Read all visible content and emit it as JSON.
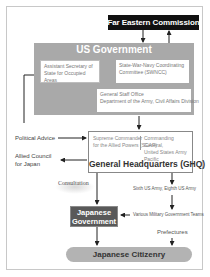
{
  "diagram": {
    "nodes": {
      "far_eastern_commission": "Far Eastern Commission",
      "us_government": "US Government",
      "assistant_secretary": "Assistant Secretary of State for Occupied Areas",
      "swncc": "State-War-Navy Coordinating Committee (SWNCC)",
      "general_staff_office_line1": "General Staff Office",
      "general_staff_office_line2": "Department of the Army, Civil Affairs Division",
      "scap_line1": "Supreme Commander",
      "scap_line2": "for the Allied Powers (SCAP)",
      "cg_line1": "Commanding General,",
      "cg_line2": "United States Army Pacific",
      "ghq": "General Headquarters (GHQ)",
      "political_advice": "Political Advice",
      "allied_council_line1": "Allied Council",
      "allied_council_line2": "for Japan",
      "consultation": "Consultation",
      "sixth_eighth_army": "Sixth US Army, Eighth US Army",
      "military_govt_teams": "Various Military Government Teams",
      "prefectures": "Prefectures",
      "japanese_government_line1": "Japanese",
      "japanese_government_line2": "Government",
      "japanese_citizenry": "Japanese Citizenry"
    },
    "edges": [
      {
        "from": "US Government",
        "to": "Far Eastern Commission"
      },
      {
        "from": "Far Eastern Commission",
        "to": "US Government"
      },
      {
        "from": "State-War-Navy Coordinating Committee (SWNCC)",
        "to": "Assistant Secretary of State for Occupied Areas"
      },
      {
        "from": "Assistant Secretary of State for Occupied Areas",
        "to": "General Staff Office"
      },
      {
        "from": "General Staff Office",
        "to": "General Headquarters (GHQ)"
      },
      {
        "from": "Assistant Secretary of State for Occupied Areas",
        "to": "General Headquarters (GHQ)",
        "label": "Political Advice"
      },
      {
        "from": "General Headquarters (GHQ)",
        "to": "Allied Council for Japan"
      },
      {
        "from": "General Headquarters (GHQ)",
        "to": "Japanese Government",
        "label": "Consultation"
      },
      {
        "from": "General Headquarters (GHQ)",
        "to": "Sixth US Army, Eighth US Army"
      },
      {
        "from": "Sixth US Army, Eighth US Army",
        "to": "Various Military Government Teams"
      },
      {
        "from": "Various Military Government Teams",
        "to": "Japanese Government"
      },
      {
        "from": "Japanese Government",
        "to": "Japanese Citizenry"
      },
      {
        "from": "Prefectures",
        "to": "Japanese Citizenry"
      }
    ],
    "colors": {
      "fec_bg": "#111111",
      "us_gov_bg": "#a9a9a9",
      "japanese_gov_bg": "#595959",
      "citizenry_bg": "#b3b3b3",
      "line": "#333333"
    }
  }
}
